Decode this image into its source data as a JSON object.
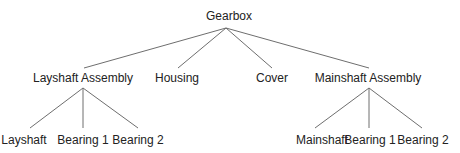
{
  "diagram": {
    "type": "tree",
    "root": {
      "label": "Gearbox",
      "children": [
        {
          "label": "Layshaft Assembly",
          "children": [
            {
              "label": "Layshaft"
            },
            {
              "label": "Bearing 1"
            },
            {
              "label": "Bearing 2"
            }
          ]
        },
        {
          "label": "Housing"
        },
        {
          "label": "Cover"
        },
        {
          "label": "Mainshaft Assembly",
          "children": [
            {
              "label": "Mainshaft"
            },
            {
              "label": "Bearing 1"
            },
            {
              "label": "Bearing 2"
            }
          ]
        }
      ]
    },
    "edge_color": "#6e6e6e",
    "text_color": "#222222"
  },
  "nodes": {
    "gearbox": "Gearbox",
    "layshaft_assembly": "Layshaft Assembly",
    "housing": "Housing",
    "cover": "Cover",
    "mainshaft_assembly": "Mainshaft Assembly",
    "layshaft": "Layshaft",
    "layshaft_bearing_1": "Bearing 1",
    "layshaft_bearing_2": "Bearing 2",
    "mainshaft": "Mainshaft",
    "mainshaft_bearing_1": "Bearing 1",
    "mainshaft_bearing_2": "Bearing 2"
  }
}
